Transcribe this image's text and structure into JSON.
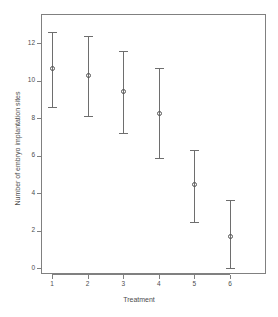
{
  "chart_data": {
    "type": "scatter",
    "title": "",
    "xlabel": "Treatment",
    "ylabel": "Number of embryo implantation sites",
    "categories": [
      "1",
      "2",
      "3",
      "4",
      "5",
      "6"
    ],
    "values": [
      10.65,
      10.25,
      9.4,
      8.25,
      4.45,
      1.7
    ],
    "error_low": [
      8.6,
      8.1,
      7.2,
      5.85,
      2.45,
      0.0
    ],
    "error_high": [
      12.6,
      12.4,
      11.6,
      10.65,
      6.3,
      3.65
    ],
    "ylim": [
      -0.2,
      13.2
    ],
    "yticks": [
      0,
      2,
      4,
      6,
      8,
      10,
      12
    ],
    "ytick_labels": [
      "0",
      "2",
      "4",
      "6",
      "8",
      "10",
      "12"
    ],
    "xtick_labels": [
      "1",
      "2",
      "3",
      "4",
      "5",
      "6"
    ],
    "grid": false,
    "legend": false,
    "marker": "open-circle",
    "series": [
      {
        "name": "mean with 95% CI",
        "points": [
          {
            "x": "1",
            "mean": 10.65,
            "lower": 8.6,
            "upper": 12.6
          },
          {
            "x": "2",
            "mean": 10.25,
            "lower": 8.1,
            "upper": 12.4
          },
          {
            "x": "3",
            "mean": 9.4,
            "lower": 7.2,
            "upper": 11.6
          },
          {
            "x": "4",
            "mean": 8.25,
            "lower": 5.85,
            "upper": 10.65
          },
          {
            "x": "5",
            "mean": 4.45,
            "lower": 2.45,
            "upper": 6.3
          },
          {
            "x": "6",
            "mean": 1.7,
            "lower": 0.0,
            "upper": 3.65
          }
        ]
      }
    ],
    "colors": {
      "marker": "#555555",
      "errorbar": "#6e6e6e",
      "axis": "#808080",
      "text": "#4d4d4d",
      "background": "#ffffff"
    }
  }
}
